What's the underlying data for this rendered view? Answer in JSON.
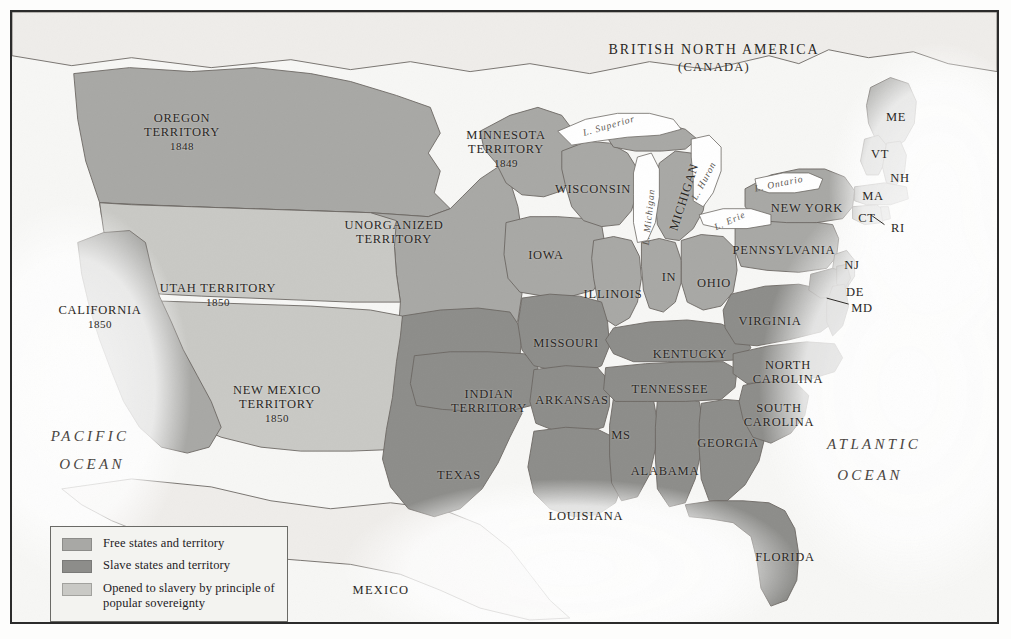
{
  "map": {
    "title_hidden": "",
    "background_color": "#f7f7f5",
    "colors": {
      "free": "#a8a8a5",
      "slave": "#8d8d8a",
      "popular_sovereignty": "#c9c9c5",
      "foreign_land": "#eceae6",
      "water": "#ffffff",
      "border_line": "#6b6762",
      "frame": "#2b2b2b"
    },
    "countries": [
      {
        "name": "british_north_america",
        "line1": "BRITISH NORTH AMERICA",
        "line2": "(CANADA)",
        "x": 702,
        "y": 38
      },
      {
        "name": "mexico",
        "label": "MEXICO",
        "x": 369,
        "y": 578
      }
    ],
    "oceans": [
      {
        "name": "pacific-ocean",
        "line1": "PACIFIC",
        "line2": "OCEAN",
        "x": 78,
        "y": 424,
        "x2": 80,
        "y2": 452
      },
      {
        "name": "atlantic-ocean",
        "line1": "ATLANTIC",
        "line2": "OCEAN",
        "x": 862,
        "y": 432,
        "x2": 858,
        "y2": 463
      }
    ],
    "lakes": [
      {
        "name": "lake-superior",
        "label": "L. Superior",
        "x": 597,
        "y": 114,
        "rotate": -16
      },
      {
        "name": "lake-michigan",
        "label": "L. Michigan",
        "x": 637,
        "y": 205,
        "rotate": -84
      },
      {
        "name": "lake-huron",
        "label": "L. Huron",
        "x": 692,
        "y": 169,
        "rotate": -62
      },
      {
        "name": "lake-ontario",
        "label": "L. Ontario",
        "x": 767,
        "y": 172,
        "rotate": -12
      },
      {
        "name": "lake-erie",
        "label": "L. Erie",
        "x": 718,
        "y": 209,
        "rotate": -24
      }
    ],
    "free_states": [
      {
        "name": "california",
        "line1": "CALIFORNIA",
        "year": "1850",
        "x": 88,
        "y": 305
      },
      {
        "name": "oregon-territory",
        "line1": "OREGON",
        "line2": "TERRITORY",
        "year": "1848",
        "x": 170,
        "y": 120
      },
      {
        "name": "minnesota-territory",
        "line1": "MINNESOTA",
        "line2": "TERRITORY",
        "year": "1849",
        "x": 494,
        "y": 137
      },
      {
        "name": "unorganized-territory",
        "line1": "UNORGANIZED",
        "line2": "TERRITORY",
        "x": 382,
        "y": 220
      },
      {
        "name": "wisconsin",
        "label": "WISCONSIN",
        "x": 581,
        "y": 177
      },
      {
        "name": "michigan",
        "label": "MICHIGAN",
        "x": 672,
        "y": 185,
        "rotate": -72
      },
      {
        "name": "iowa",
        "label": "IOWA",
        "x": 534,
        "y": 243
      },
      {
        "name": "illinois",
        "label": "ILLINOIS",
        "x": 601,
        "y": 282
      },
      {
        "name": "indiana",
        "label": "IN",
        "x": 657,
        "y": 265
      },
      {
        "name": "ohio",
        "label": "OHIO",
        "x": 702,
        "y": 271
      },
      {
        "name": "pennsylvania",
        "label": "PENNSYLVANIA",
        "x": 772,
        "y": 238
      },
      {
        "name": "new-york",
        "label": "NEW YORK",
        "x": 795,
        "y": 196
      },
      {
        "name": "maine",
        "label": "ME",
        "x": 884,
        "y": 105
      },
      {
        "name": "vermont",
        "label": "VT",
        "x": 868,
        "y": 142
      },
      {
        "name": "new-hampshire",
        "label": "NH",
        "x": 888,
        "y": 166
      },
      {
        "name": "massachusetts",
        "label": "MA",
        "x": 861,
        "y": 184
      },
      {
        "name": "connecticut",
        "label": "CT",
        "x": 855,
        "y": 206
      },
      {
        "name": "rhode-island",
        "label": "RI",
        "x": 886,
        "y": 216
      },
      {
        "name": "new-jersey",
        "label": "NJ",
        "x": 840,
        "y": 253
      }
    ],
    "slave_states": [
      {
        "name": "texas",
        "label": "TEXAS",
        "x": 447,
        "y": 463
      },
      {
        "name": "indian-territory",
        "line1": "INDIAN",
        "line2": "TERRITORY",
        "x": 477,
        "y": 389
      },
      {
        "name": "arkansas",
        "label": "ARKANSAS",
        "x": 560,
        "y": 388
      },
      {
        "name": "missouri",
        "label": "MISSOURI",
        "x": 554,
        "y": 331
      },
      {
        "name": "louisiana",
        "label": "LOUISIANA",
        "x": 574,
        "y": 504
      },
      {
        "name": "mississippi",
        "label": "MS",
        "x": 609,
        "y": 423
      },
      {
        "name": "alabama",
        "label": "ALABAMA",
        "x": 653,
        "y": 459
      },
      {
        "name": "tennessee",
        "label": "TENNESSEE",
        "x": 658,
        "y": 377
      },
      {
        "name": "kentucky",
        "label": "KENTUCKY",
        "x": 678,
        "y": 342
      },
      {
        "name": "georgia",
        "label": "GEORGIA",
        "x": 716,
        "y": 431
      },
      {
        "name": "florida",
        "label": "FLORIDA",
        "x": 773,
        "y": 545
      },
      {
        "name": "south-carolina",
        "line1": "SOUTH",
        "line2": "CAROLINA",
        "x": 767,
        "y": 403
      },
      {
        "name": "north-carolina",
        "line1": "NORTH",
        "line2": "CAROLINA",
        "x": 776,
        "y": 360
      },
      {
        "name": "virginia",
        "label": "VIRGINIA",
        "x": 758,
        "y": 309
      },
      {
        "name": "delaware",
        "label": "DE",
        "x": 843,
        "y": 280
      },
      {
        "name": "maryland",
        "label": "MD",
        "x": 850,
        "y": 296
      }
    ],
    "popular_sovereignty_regions": [
      {
        "name": "utah-territory",
        "line1": "UTAH TERRITORY",
        "year": "1850",
        "x": 206,
        "y": 283
      },
      {
        "name": "new-mexico-territory",
        "line1": "NEW MEXICO",
        "line2": "TERRITORY",
        "year": "1850",
        "x": 265,
        "y": 392
      }
    ]
  },
  "legend": {
    "items": [
      {
        "name": "legend-free",
        "swatch_color": "#a8a8a5",
        "label": "Free states and territory"
      },
      {
        "name": "legend-slave",
        "swatch_color": "#8d8d8a",
        "label": "Slave states and territory"
      },
      {
        "name": "legend-popular-sovereignty",
        "swatch_color": "#c9c9c5",
        "label": "Opened to slavery by principle of\npopular sovereignty"
      }
    ]
  }
}
